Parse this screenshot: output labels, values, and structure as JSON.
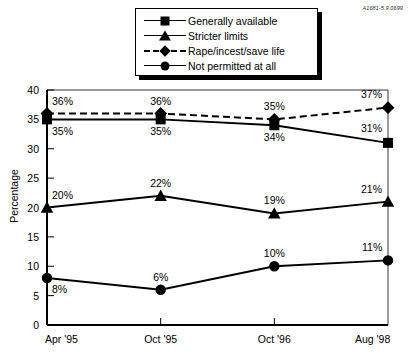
{
  "corner_code": "A1681-5.9.0699",
  "legend": {
    "items": [
      {
        "label": "Generally available",
        "marker": "square-marker-icon",
        "dashed": false
      },
      {
        "label": "Stricter limits",
        "marker": "triangle-marker-icon",
        "dashed": false
      },
      {
        "label": "Rape/incest/save life",
        "marker": "diamond-marker-icon",
        "dashed": true
      },
      {
        "label": "Not permitted at all",
        "marker": "circle-marker-icon",
        "dashed": false
      }
    ]
  },
  "chart_data": {
    "type": "line",
    "title": "",
    "xlabel": "",
    "ylabel": "Percentage",
    "categories": [
      "Apr '95",
      "Oct '95",
      "Oct '96",
      "Aug '98"
    ],
    "ylim": [
      0,
      40
    ],
    "yticks": [
      0,
      5,
      10,
      15,
      20,
      25,
      30,
      35,
      40
    ],
    "grid": false,
    "legend_position": "top-center",
    "series": [
      {
        "name": "Generally available",
        "marker": "square",
        "dashed": false,
        "values": [
          35,
          35,
          34,
          31
        ],
        "labels": [
          "35%",
          "35%",
          "34%",
          "31%"
        ],
        "label_side": [
          "below",
          "below",
          "below",
          "above"
        ]
      },
      {
        "name": "Stricter limits",
        "marker": "triangle",
        "dashed": false,
        "values": [
          20,
          22,
          19,
          21
        ],
        "labels": [
          "20%",
          "22%",
          "19%",
          "21%"
        ],
        "label_side": [
          "above",
          "above",
          "above",
          "above"
        ]
      },
      {
        "name": "Rape/incest/save life",
        "marker": "diamond",
        "dashed": true,
        "values": [
          36,
          36,
          35,
          37
        ],
        "labels": [
          "36%",
          "36%",
          "35%",
          "37%"
        ],
        "label_side": [
          "above",
          "above",
          "above",
          "above"
        ]
      },
      {
        "name": "Not permitted at all",
        "marker": "circle",
        "dashed": false,
        "values": [
          8,
          6,
          10,
          11
        ],
        "labels": [
          "8%",
          "6%",
          "10%",
          "11%"
        ],
        "label_side": [
          "below",
          "above",
          "above",
          "above"
        ]
      }
    ]
  }
}
